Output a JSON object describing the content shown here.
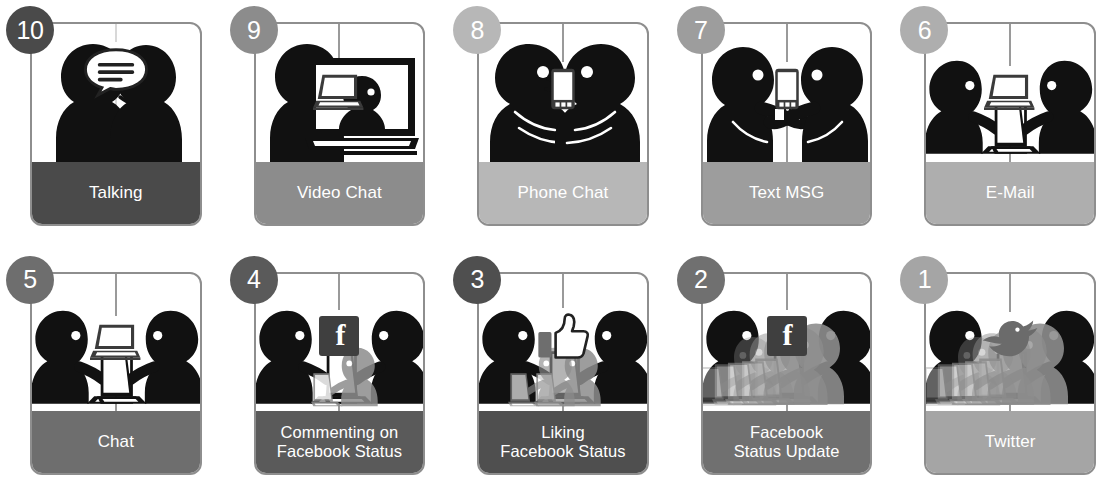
{
  "meta": {
    "rows": 2,
    "columns": 5
  },
  "palette": {
    "card_border": "#8e8e8e",
    "divider": "#9a9a9a",
    "figure": "#111111",
    "figure_faded": "#8d8d8d",
    "label_text": "#ffffff",
    "page_background": "#ffffff"
  },
  "cards": [
    {
      "number": "10",
      "label": "Talking",
      "label_lines": [
        "Talking"
      ],
      "icon": "speech-bubble-icon",
      "footer_color": "#4a4a4a",
      "badge_color": "#4a4a4a",
      "divider": "faint",
      "scene": "two-people-talking",
      "crowd": 0
    },
    {
      "number": "9",
      "label": "Video Chat",
      "label_lines": [
        "Video Chat"
      ],
      "icon": "laptop-icon",
      "footer_color": "#8c8c8c",
      "badge_color": "#8c8c8c",
      "divider": "solid",
      "scene": "person-and-video-monitor",
      "crowd": 0
    },
    {
      "number": "8",
      "label": "Phone Chat",
      "label_lines": [
        "Phone Chat"
      ],
      "icon": "phone-icon",
      "footer_color": "#b7b7b7",
      "badge_color": "#b7b7b7",
      "divider": "solid",
      "scene": "two-people-on-phone",
      "crowd": 0
    },
    {
      "number": "7",
      "label": "Text MSG",
      "label_lines": [
        "Text MSG"
      ],
      "icon": "phone-icon",
      "footer_color": "#9d9d9d",
      "badge_color": "#9d9d9d",
      "divider": "solid",
      "scene": "two-people-texting",
      "crowd": 0
    },
    {
      "number": "6",
      "label": "E-Mail",
      "label_lines": [
        "E-Mail"
      ],
      "icon": "laptop-icon",
      "footer_color": "#aeaeae",
      "badge_color": "#aeaeae",
      "divider": "solid",
      "scene": "two-people-at-laptops",
      "crowd": 0
    },
    {
      "number": "5",
      "label": "Chat",
      "label_lines": [
        "Chat"
      ],
      "icon": "laptop-icon",
      "footer_color": "#6e6e6e",
      "badge_color": "#6e6e6e",
      "divider": "solid",
      "scene": "two-people-at-laptops",
      "crowd": 0
    },
    {
      "number": "4",
      "label": "Commenting on Facebook Status",
      "label_lines": [
        "Commenting on",
        "Facebook Status"
      ],
      "icon": "facebook-icon",
      "footer_color": "#5a5a5a",
      "badge_color": "#5a5a5a",
      "divider": "solid",
      "scene": "laptops-with-small-crowd",
      "crowd": 1
    },
    {
      "number": "3",
      "label": "Liking Facebook Status",
      "label_lines": [
        "Liking",
        "Facebook Status"
      ],
      "icon": "thumbs-up-icon",
      "footer_color": "#4f4f4f",
      "badge_color": "#4f4f4f",
      "divider": "solid",
      "scene": "laptops-with-small-crowd",
      "crowd": 2
    },
    {
      "number": "2",
      "label": "Facebook Status Update",
      "label_lines": [
        "Facebook",
        "Status Update"
      ],
      "icon": "facebook-icon",
      "footer_color": "#707070",
      "badge_color": "#707070",
      "divider": "solid",
      "scene": "laptops-with-large-crowd",
      "crowd": 3
    },
    {
      "number": "1",
      "label": "Twitter",
      "label_lines": [
        "Twitter"
      ],
      "icon": "twitter-bird-icon",
      "footer_color": "#a5a5a5",
      "badge_color": "#a5a5a5",
      "divider": "solid",
      "scene": "laptops-with-large-crowd",
      "crowd": 3
    }
  ]
}
